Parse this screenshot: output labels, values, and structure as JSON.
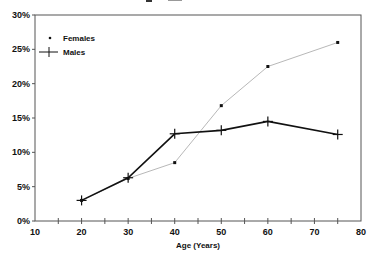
{
  "chart_data": {
    "type": "line",
    "title": "",
    "xlabel": "Age (Years)",
    "ylabel": "",
    "xlim": [
      10,
      80
    ],
    "ylim": [
      0,
      30
    ],
    "x_ticks": [
      10,
      20,
      30,
      40,
      50,
      60,
      70,
      80
    ],
    "x_minor_ticks": [
      15,
      25,
      35,
      45,
      55,
      65,
      75
    ],
    "y_ticks": [
      0,
      5,
      10,
      15,
      20,
      25,
      30
    ],
    "y_tick_labels": [
      "0%",
      "5%",
      "10%",
      "15%",
      "20%",
      "25%",
      "30%"
    ],
    "grid": false,
    "legend_position": "upper left",
    "x": [
      20,
      30,
      40,
      50,
      60,
      75
    ],
    "series": [
      {
        "name": "Females",
        "marker": "dot",
        "line_color": "#b0b0b0",
        "marker_color": "#111111",
        "values": [
          3.0,
          6.2,
          8.5,
          16.8,
          22.5,
          26.0
        ]
      },
      {
        "name": "Males",
        "marker": "plus",
        "line_color": "#111111",
        "marker_color": "#111111",
        "values": [
          3.0,
          6.3,
          12.7,
          13.2,
          14.5,
          12.6
        ]
      }
    ]
  },
  "legend": {
    "females_label": "Females",
    "males_label": "Males"
  },
  "axes": {
    "x_title": "Age (Years)",
    "x_labels": [
      "10",
      "20",
      "30",
      "40",
      "50",
      "60",
      "70",
      "80"
    ],
    "y_labels": [
      "0%",
      "5%",
      "10%",
      "15%",
      "20%",
      "25%",
      "30%"
    ]
  }
}
